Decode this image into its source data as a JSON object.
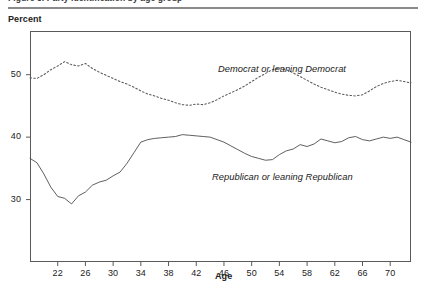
{
  "header": {
    "clipped_title": "Figure 3. Party identification by age group",
    "rule_color": "#8a8a8a"
  },
  "axes": {
    "y_title": "Percent",
    "x_title": "Age",
    "y_ticks": [
      30,
      40,
      50
    ],
    "y_tick_labels": [
      "30",
      "40",
      "50"
    ],
    "x_ticks": [
      22,
      26,
      30,
      34,
      38,
      42,
      46,
      50,
      54,
      58,
      62,
      66,
      70
    ],
    "x_tick_labels": [
      "22",
      "26",
      "30",
      "34",
      "38",
      "42",
      "46",
      "50",
      "54",
      "58",
      "62",
      "66",
      "70"
    ]
  },
  "annotations": {
    "democrat": "Democrat or leaning Democrat",
    "republican": "Republican or leaning Republican"
  },
  "colors": {
    "line": "#4d4d4d",
    "frame": "#5a5a5a",
    "text": "#1a1a1a",
    "background": "#ffffff"
  },
  "chart_data": {
    "type": "line",
    "title": "Party identification by age",
    "xlabel": "Age",
    "ylabel": "Percent",
    "xlim": [
      18,
      73
    ],
    "ylim": [
      20,
      57
    ],
    "grid": false,
    "legend": "inline annotations",
    "x": [
      18,
      19,
      20,
      21,
      22,
      23,
      24,
      25,
      26,
      27,
      28,
      29,
      30,
      31,
      32,
      33,
      34,
      35,
      36,
      37,
      38,
      39,
      40,
      41,
      42,
      43,
      44,
      45,
      46,
      47,
      48,
      49,
      50,
      51,
      52,
      53,
      54,
      55,
      56,
      57,
      58,
      59,
      60,
      61,
      62,
      63,
      64,
      65,
      66,
      67,
      68,
      69,
      70,
      71,
      72,
      73
    ],
    "series": [
      {
        "name": "Democrat or leaning Democrat",
        "style": "dotted",
        "values": [
          49.5,
          49.4,
          50.0,
          50.8,
          51.4,
          52.1,
          51.6,
          51.4,
          51.8,
          51.0,
          50.4,
          49.9,
          49.4,
          48.9,
          48.5,
          48.0,
          47.4,
          46.9,
          46.6,
          46.2,
          45.9,
          45.5,
          45.2,
          45.1,
          45.3,
          45.2,
          45.5,
          46.0,
          46.6,
          47.1,
          47.6,
          48.2,
          48.9,
          49.6,
          50.2,
          50.8,
          51.1,
          50.8,
          50.3,
          49.7,
          49.1,
          48.5,
          48.0,
          47.6,
          47.2,
          46.9,
          46.7,
          46.6,
          46.8,
          47.4,
          48.1,
          48.6,
          48.9,
          49.1,
          48.9,
          48.7
        ]
      },
      {
        "name": "Republican or leaning Republican",
        "style": "solid",
        "values": [
          36.6,
          35.9,
          34.1,
          32.0,
          30.5,
          30.2,
          29.3,
          30.6,
          31.2,
          32.3,
          32.8,
          33.1,
          33.8,
          34.4,
          35.8,
          37.5,
          39.2,
          39.6,
          39.8,
          39.9,
          40.0,
          40.1,
          40.4,
          40.3,
          40.2,
          40.1,
          40.0,
          39.6,
          39.2,
          38.6,
          38.0,
          37.4,
          36.9,
          36.6,
          36.3,
          36.4,
          37.2,
          37.8,
          38.1,
          38.8,
          38.5,
          38.9,
          39.7,
          39.4,
          39.1,
          39.3,
          39.9,
          40.1,
          39.6,
          39.4,
          39.7,
          40.0,
          39.8,
          40.0,
          39.6,
          39.2
        ]
      }
    ]
  }
}
